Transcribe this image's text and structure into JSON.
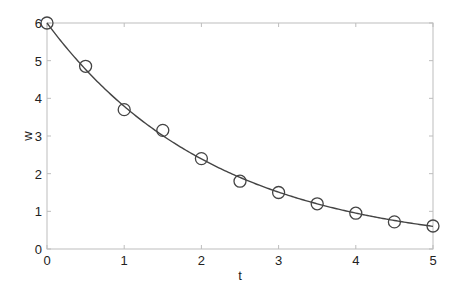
{
  "chart_data": {
    "type": "line",
    "title": "",
    "xlabel": "t",
    "ylabel": "w",
    "xlim": [
      0,
      5
    ],
    "ylim": [
      0,
      6
    ],
    "xticks": [
      0,
      1,
      2,
      3,
      4,
      5
    ],
    "yticks": [
      0,
      1,
      2,
      3,
      4,
      5,
      6
    ],
    "grid": false,
    "legend": null,
    "series": [
      {
        "name": "fit",
        "style": "line",
        "color": "#444444",
        "model": "w = 6*exp(-0.46*t)"
      },
      {
        "name": "data",
        "style": "markers",
        "marker": "circle-open",
        "color": "#444444",
        "x": [
          0,
          0.5,
          1,
          1.5,
          2,
          2.5,
          3,
          3.5,
          4,
          4.5,
          5
        ],
        "y": [
          6.0,
          4.85,
          3.7,
          3.15,
          2.4,
          1.8,
          1.5,
          1.2,
          0.95,
          0.72,
          0.61
        ]
      }
    ]
  },
  "colors": {
    "axis": "#bdbdbd",
    "line": "#444444",
    "marker": "#444444",
    "text": "#222222"
  }
}
